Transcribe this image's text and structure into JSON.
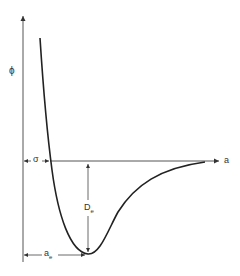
{
  "diagram": {
    "y_axis_label": "ϕ",
    "x_axis_label": "a",
    "sigma_label": "σ",
    "depth_label_base": "D",
    "depth_label_sub": "e",
    "equilibrium_label_base": "a",
    "equilibrium_label_sub": "e",
    "colors": {
      "line": "#222222",
      "axis": "#555555",
      "text": "#333333"
    }
  }
}
